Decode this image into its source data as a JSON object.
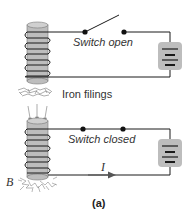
{
  "figure": {
    "caption": "(a)",
    "colors": {
      "wire": "#1a1a1a",
      "core": "#b8b8b8",
      "battery_bg": "#bdbdbd",
      "arrow": "#555555"
    }
  },
  "top_circuit": {
    "switch_label": "Switch open",
    "filings_label": "Iron filings",
    "switch_state": "open"
  },
  "bottom_circuit": {
    "switch_label": "Switch closed",
    "current_label": "I",
    "field_label": "B",
    "switch_state": "closed"
  }
}
